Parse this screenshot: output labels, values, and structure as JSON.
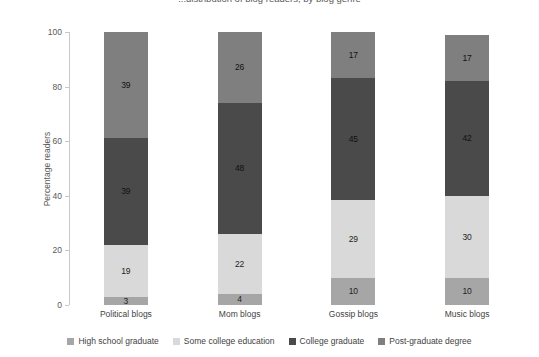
{
  "chart_data": {
    "type": "bar",
    "subtype": "stacked-bar-100",
    "title": "...distribution of blog readers, by blog genre",
    "xlabel": "",
    "ylabel": "Percentage readers",
    "ylim": [
      0,
      100
    ],
    "yticks": [
      0,
      20,
      40,
      60,
      80,
      100
    ],
    "grid": false,
    "legend_position": "bottom",
    "categories": [
      "Political blogs",
      "Mom blogs",
      "Gossip blogs",
      "Music blogs"
    ],
    "series": [
      {
        "name": "High school graduate",
        "color": "#a6a6a6",
        "values": [
          3,
          4,
          10,
          10
        ]
      },
      {
        "name": "Some college education",
        "color": "#d9d9d9",
        "values": [
          19,
          22,
          29,
          30
        ]
      },
      {
        "name": "College graduate",
        "color": "#4a4a4a",
        "values": [
          39,
          48,
          45,
          42
        ]
      },
      {
        "name": "Post-graduate degree",
        "color": "#7f7f7f",
        "values": [
          39,
          26,
          17,
          17
        ]
      }
    ]
  },
  "axis": {
    "y_title": "Percentage readers",
    "y_tick_labels": [
      "0",
      "20",
      "40",
      "60",
      "80",
      "100"
    ]
  }
}
